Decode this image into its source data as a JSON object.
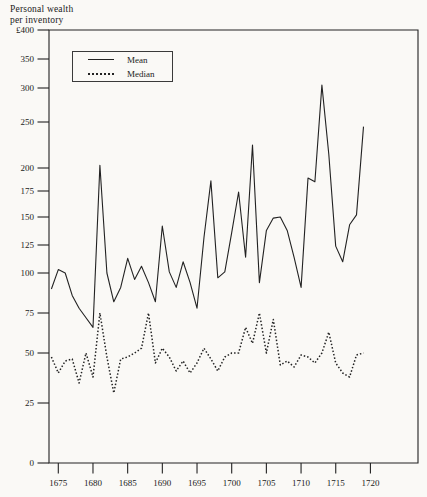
{
  "title": {
    "line1": "Personal wealth",
    "line2": "per inventory"
  },
  "colors": {
    "ink": "#222222",
    "paper": "#faf9f6"
  },
  "legend": {
    "items": [
      {
        "label": "Mean",
        "style": "solid"
      },
      {
        "label": "Median",
        "style": "dotted"
      }
    ]
  },
  "chart_data": {
    "type": "line",
    "title": "Personal wealth per inventory",
    "ylabel": "£ per inventory",
    "xlabel": "year",
    "grid": false,
    "legend_position": "top-left-box",
    "years": [
      1674,
      1675,
      1676,
      1677,
      1678,
      1679,
      1680,
      1681,
      1682,
      1683,
      1684,
      1685,
      1686,
      1687,
      1688,
      1689,
      1690,
      1691,
      1692,
      1693,
      1694,
      1695,
      1696,
      1697,
      1698,
      1699,
      1700,
      1701,
      1702,
      1703,
      1704,
      1705,
      1706,
      1707,
      1708,
      1709,
      1710,
      1711,
      1712,
      1713,
      1714,
      1715,
      1716,
      1717,
      1718,
      1719
    ],
    "series": [
      {
        "name": "Mean",
        "style": "solid",
        "values": [
          90,
          103,
          100,
          86,
          78,
          72,
          66,
          203,
          100,
          82,
          91,
          113,
          96,
          106,
          94,
          82,
          142,
          101,
          91,
          110,
          94,
          78,
          132,
          186,
          97,
          101,
          136,
          174,
          114,
          225,
          94,
          138,
          149,
          150,
          138,
          114,
          91,
          189,
          185,
          305,
          215,
          124,
          110,
          143,
          152,
          245
        ]
      },
      {
        "name": "Median",
        "style": "dotted",
        "values": [
          48,
          40,
          46,
          47,
          35,
          50,
          38,
          75,
          48,
          30,
          47,
          48,
          50,
          53,
          75,
          45,
          53,
          48,
          41,
          46,
          40,
          45,
          53,
          47,
          41,
          48,
          50,
          50,
          66,
          56,
          75,
          50,
          71,
          44,
          46,
          43,
          49,
          48,
          45,
          50,
          63,
          45,
          40,
          38,
          49,
          50
        ]
      }
    ],
    "y_axis": {
      "ticks": [
        {
          "label": "£400",
          "value": 400
        },
        {
          "label": "350",
          "value": 350
        },
        {
          "label": "300",
          "value": 300
        },
        {
          "label": "250",
          "value": 250
        },
        {
          "label": "200",
          "value": 200
        },
        {
          "label": "175",
          "value": 175
        },
        {
          "label": "150",
          "value": 150
        },
        {
          "label": "125",
          "value": 125
        },
        {
          "label": "100",
          "value": 100
        },
        {
          "label": "75",
          "value": 75
        },
        {
          "label": "50",
          "value": 50
        },
        {
          "label": "25",
          "value": 25
        },
        {
          "label": "0",
          "value": 0
        }
      ],
      "range": [
        0,
        400
      ],
      "scale": "irregular-piecewise"
    },
    "x_axis": {
      "ticks": [
        1675,
        1680,
        1685,
        1690,
        1695,
        1700,
        1705,
        1710,
        1715,
        1720
      ],
      "range": [
        1673.7,
        1726.8
      ]
    },
    "layout": {
      "plot_box": {
        "left": 49,
        "top": 30,
        "right": 418,
        "bottom": 463
      },
      "x_px_per_year": 6.936,
      "x_of_1675": 58.3,
      "y_anchors": [
        [
          0,
          463
        ],
        [
          25,
          403
        ],
        [
          50,
          353
        ],
        [
          75,
          313
        ],
        [
          100,
          273
        ],
        [
          125,
          245
        ],
        [
          150,
          217
        ],
        [
          175,
          191
        ],
        [
          200,
          168
        ],
        [
          250,
          122
        ],
        [
          300,
          88
        ],
        [
          350,
          59
        ],
        [
          400,
          30
        ]
      ]
    }
  }
}
